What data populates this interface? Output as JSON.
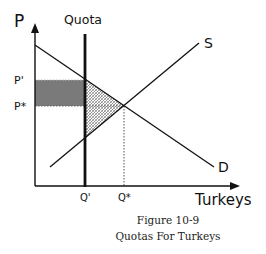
{
  "diagram": {
    "type": "supply-demand",
    "axes": {
      "y_label": "P",
      "x_label": "Turkeys"
    },
    "curves": {
      "supply_label": "S",
      "demand_label": "D",
      "quota_label": "Quota"
    },
    "price_ticks": {
      "p_prime": "P'",
      "p_star": "P*"
    },
    "quantity_ticks": {
      "q_prime": "Q'",
      "q_star": "Q*"
    },
    "regions": {
      "shaded_rectangle": "gray area between P* and P' up to Q'",
      "hatched_triangle": "cross-hatched area between Q', demand and supply"
    },
    "colors": {
      "line": "#111111",
      "shade": "#7a7a7a",
      "hatch": "#555555"
    }
  },
  "caption": {
    "line1": "Figure 10-9",
    "line2": "Quotas For Turkeys"
  }
}
